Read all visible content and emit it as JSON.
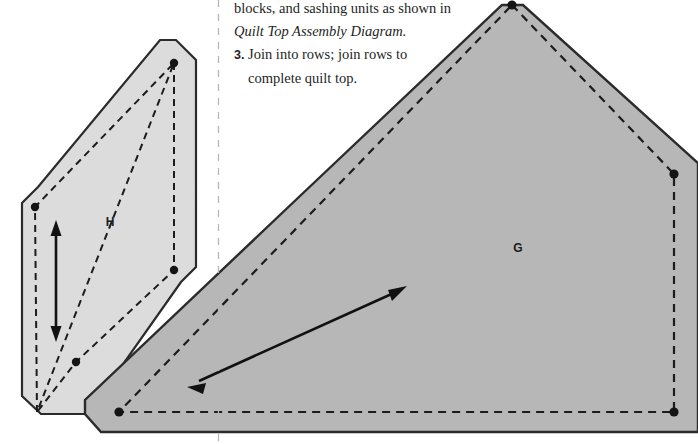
{
  "page": {
    "width": 698,
    "height": 444,
    "background": "#ffffff"
  },
  "instructions": {
    "line1": "blocks, and sashing units as shown in",
    "line2": "Quilt Top Assembly Diagram.",
    "step3_number": "3.",
    "step3_line1": "Join into rows; join rows to",
    "step3_line2": "complete quilt top."
  },
  "pieces": {
    "h": {
      "label": "H",
      "label_x": 110,
      "label_y": 222,
      "fill": "#dcdcdc",
      "stroke": "#2b2b2b",
      "outline": "176,40 191,36 196,44 196,270 181,281 181,281 89,412 44,412 22,399 22,203 30,191 30,191 160,40",
      "outline_points": "176,40 196,58 196,268 182,282 88,414 41,414 22,396 22,202 38,187 160,40",
      "seam": "174,63 174,270 76,362 35,362 35,207 174,63",
      "seam_path": "M 174,63 L 174,270 L 76,362 L 37,412 L 35,207 Z",
      "dots": [
        {
          "x": 174,
          "y": 63
        },
        {
          "x": 174,
          "y": 270
        },
        {
          "x": 76,
          "y": 362
        },
        {
          "x": 35,
          "y": 207
        }
      ],
      "grain_arrow": {
        "x": 56,
        "y1": 223,
        "y2": 339
      }
    },
    "g": {
      "label": "G",
      "label_x": 518,
      "label_y": 248,
      "fill": "#b7b7b7",
      "stroke": "#2b2b2b",
      "outline_points": "512,5 530,5 698,160 698,430 140,430 100,430 85,412 85,400 300,196 497,5",
      "seam_path": "M 512,5 L 674,174 L 674,412 L 119,412 Z",
      "dots": [
        {
          "x": 512,
          "y": 5
        },
        {
          "x": 674,
          "y": 174
        },
        {
          "x": 674,
          "y": 412
        },
        {
          "x": 119,
          "y": 412
        }
      ],
      "grain_arrow": {
        "x1": 190,
        "y1": 385,
        "x2": 404,
        "y2": 288
      }
    }
  },
  "divider": {
    "name": "cut-line",
    "x": 218,
    "y1": 0,
    "y2": 444,
    "color": "#b9b6b2"
  },
  "colors": {
    "ink": "#231f1e",
    "outline": "#2b2b2b",
    "h_fill": "#dcdcdc",
    "g_fill": "#b7b7b7",
    "page_bg": "#ffffff"
  }
}
